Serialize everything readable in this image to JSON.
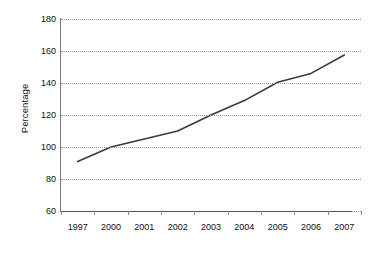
{
  "chart_data": {
    "type": "line",
    "title": "",
    "xlabel": "",
    "ylabel": "Percentage",
    "categories": [
      "1997",
      "2000",
      "2001",
      "2002",
      "2003",
      "2004",
      "2005",
      "2006",
      "2007"
    ],
    "values": [
      91,
      100,
      105,
      110,
      120,
      129,
      140.5,
      146,
      157.5
    ],
    "series": [
      {
        "name": "Percentage",
        "values": [
          91,
          100,
          105,
          110,
          120,
          129,
          140.5,
          146,
          157.5
        ]
      }
    ],
    "ylim": [
      60,
      180
    ],
    "ytick_step": 20,
    "yticks": [
      180,
      160,
      140,
      120,
      100,
      80,
      60
    ],
    "ytick_labels": [
      "180",
      "160",
      "140",
      "120",
      "100",
      "80",
      "60"
    ],
    "grid": true,
    "grid_axis": "y",
    "grid_style": "dotted",
    "legend": false,
    "legend_position": "none",
    "line_color": "#3a3a3a",
    "grid_color": "#9a9a9a",
    "axis_color": "#555555",
    "background_color": "#ffffff",
    "markers": false
  }
}
